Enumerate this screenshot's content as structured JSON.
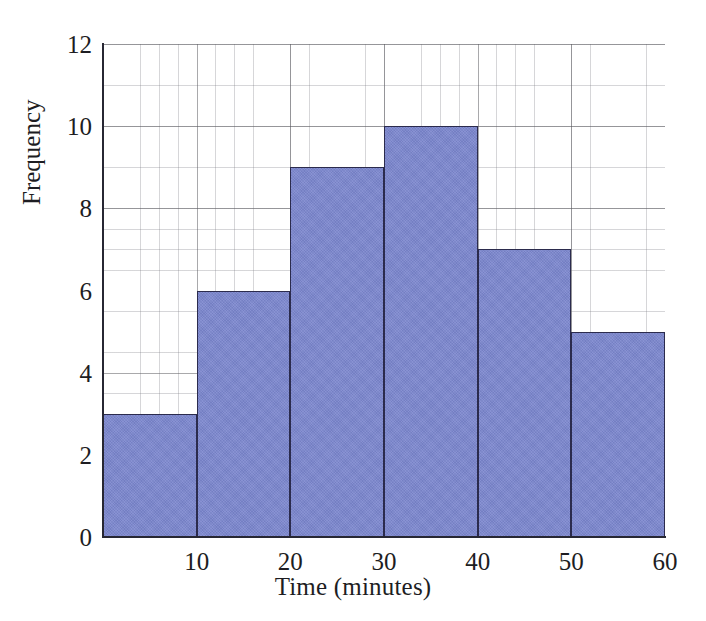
{
  "chart_data": {
    "type": "bar",
    "title": "",
    "subtitle": "",
    "xlabel": "Time (minutes)",
    "ylabel": "Frequency",
    "categories": [
      "0-10",
      "10-20",
      "20-30",
      "30-40",
      "40-50",
      "50-60"
    ],
    "bin_edges": [
      0,
      10,
      20,
      30,
      40,
      50,
      60
    ],
    "values": [
      3,
      6,
      9,
      10,
      7,
      5
    ],
    "xlim": [
      0,
      60
    ],
    "ylim": [
      0,
      12
    ],
    "x_ticks": [
      10,
      20,
      30,
      40,
      50,
      60
    ],
    "x_tick_labels": [
      "10",
      "20",
      "30",
      "40",
      "50",
      "60"
    ],
    "y_ticks": [
      0,
      2,
      4,
      6,
      8,
      10,
      12
    ],
    "y_tick_labels": [
      "0",
      "2",
      "4",
      "6",
      "8",
      "10",
      "12"
    ],
    "grid": true,
    "grid_style": "graph-paper minor and major gridlines",
    "legend": false,
    "legend_position": "none",
    "bar_fill_color": "#7b86ce",
    "bar_border_color": "#2b2b4d",
    "axis_color": "#272733",
    "background_color": "#ffffff",
    "annotations": []
  }
}
